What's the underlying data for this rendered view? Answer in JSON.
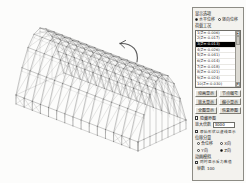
{
  "viewport": {
    "type": "3d-wireframe-structural-model",
    "description": "isometric wireframe of a long-span space-truss roof structure on columns",
    "annotation": {
      "name": "rotate-arrow",
      "direction": "counterclockwise"
    }
  },
  "panel": {
    "display_group": {
      "label": "显示选项",
      "options": [
        {
          "label": "水平位移",
          "selected": true
        },
        {
          "label": "竖向位移",
          "selected": false
        }
      ]
    },
    "loadcase_group": {
      "label": "荷载工况",
      "selected_index": 2,
      "items": [
        "1(Z=-0.006)",
        "2(Z=-0.017)",
        "3(Z=-0.013)",
        "4(Z=-0.026)",
        "5(Z=-0.041)",
        "6(Z=-0.014)",
        "7(Z=-0.018)",
        "8(Z=-0.021)",
        "9(Z=-0.024)",
        "10(Z=-0.030)"
      ]
    },
    "buttons": [
      {
        "name": "animate-button",
        "label": "动画显示"
      },
      {
        "name": "node-number-button",
        "label": "节点编号"
      },
      {
        "name": "zoom-in-button",
        "label": "放大显示"
      },
      {
        "name": "zoom-out-button",
        "label": "缩小显示"
      },
      {
        "name": "fit-view-button",
        "label": "全图显示"
      },
      {
        "name": "reset-view-button",
        "label": "恢复原图"
      }
    ],
    "hide_original": {
      "label": "隐藏原图",
      "checked": false
    },
    "scale": {
      "label": "放大倍数",
      "value": "3000"
    },
    "dashed_original": {
      "label": "原始形状以虚线显示",
      "checked": false
    },
    "component_group": {
      "label": "位移分量",
      "options": [
        {
          "label": "合位移",
          "selected": false
        },
        {
          "label": "X向",
          "selected": false
        },
        {
          "label": "Y向",
          "selected": false
        },
        {
          "label": "Z向",
          "selected": true
        }
      ]
    },
    "animation_group": {
      "label": "动画模拟",
      "checkbox": {
        "label": "同时显示反力数值",
        "checked": false
      },
      "frames": {
        "label": "帧数",
        "value": "100"
      }
    }
  },
  "colors": {
    "panel_bg": "#f3f2ee",
    "button_bg": "#e6e4dd",
    "selection_bg": "#000000",
    "selection_fg": "#ffffff",
    "wire_line": "#3c3c3c",
    "arrow": "#5a5a5a"
  }
}
